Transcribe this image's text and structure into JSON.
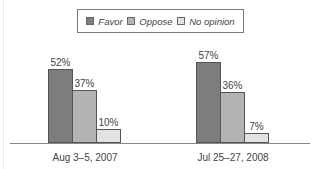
{
  "chart_data": {
    "type": "bar",
    "title": "",
    "xlabel": "",
    "ylabel": "",
    "ylim": [
      0,
      100
    ],
    "grid": false,
    "legend_position": "top",
    "categories": [
      "Aug 3–5, 2007",
      "Jul 25–27, 2008"
    ],
    "series": [
      {
        "name": "Favor",
        "values": [
          52,
          57
        ],
        "color": "#7d7d7d"
      },
      {
        "name": "Oppose",
        "values": [
          37,
          36
        ],
        "color": "#b4b4b4"
      },
      {
        "name": "No opinion",
        "values": [
          10,
          7
        ],
        "color": "#e2e2e2"
      }
    ],
    "value_labels": [
      [
        "52%",
        "37%",
        "10%"
      ],
      [
        "57%",
        "36%",
        "7%"
      ]
    ]
  },
  "legend": {
    "items": [
      {
        "label": "Favor",
        "color": "#7d7d7d"
      },
      {
        "label": "Oppose",
        "color": "#b4b4b4"
      },
      {
        "label": "No opinion",
        "color": "#e2e2e2"
      }
    ]
  }
}
